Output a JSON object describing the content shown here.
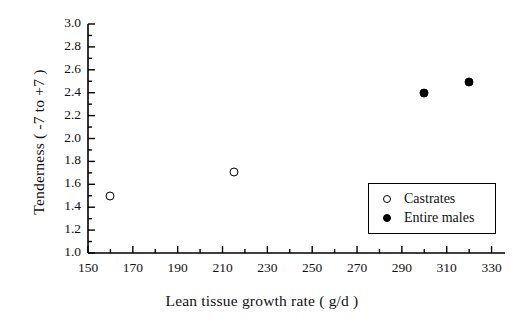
{
  "chart_data": {
    "type": "scatter",
    "title": "",
    "xlabel": "Lean tissue growth rate ( g/d )",
    "ylabel": "Tenderness ( -7 to +7 )",
    "xlim": [
      150,
      336
    ],
    "ylim": [
      1.0,
      3.0
    ],
    "grid": false,
    "legend_position": "lower-right-inside",
    "xticks": [
      150,
      170,
      190,
      210,
      230,
      250,
      270,
      290,
      310,
      330
    ],
    "xtick_labels": [
      "150",
      "170",
      "190",
      "210",
      "230",
      "250",
      "270",
      "290",
      "310",
      "330"
    ],
    "x_minor_ticks": [
      160,
      180,
      200,
      220,
      240,
      260,
      280,
      300,
      320
    ],
    "yticks": [
      1.0,
      1.2,
      1.4,
      1.6,
      1.8,
      2.0,
      2.2,
      2.4,
      2.6,
      2.8,
      3.0
    ],
    "ytick_labels": [
      "1.0",
      "1.2",
      "1.4",
      "1.6",
      "1.8",
      "2.0",
      "2.2",
      "2.4",
      "2.6",
      "2.8",
      "3.0"
    ],
    "y_minor_ticks": [
      1.1,
      1.3,
      1.5,
      1.7,
      1.9,
      2.1,
      2.3,
      2.5,
      2.7,
      2.9
    ],
    "series": [
      {
        "name": "Castrates",
        "marker": "open-circle",
        "color": "#000000",
        "points": [
          {
            "x": 160,
            "y": 1.5
          },
          {
            "x": 215,
            "y": 1.71
          }
        ]
      },
      {
        "name": "Entire males",
        "marker": "filled-circle",
        "color": "#000000",
        "points": [
          {
            "x": 300,
            "y": 2.4
          },
          {
            "x": 320,
            "y": 2.49
          }
        ]
      }
    ]
  },
  "legend": {
    "entries": [
      {
        "label": "Castrates",
        "marker": "open-circle"
      },
      {
        "label": "Entire males",
        "marker": "filled-circle"
      }
    ]
  }
}
